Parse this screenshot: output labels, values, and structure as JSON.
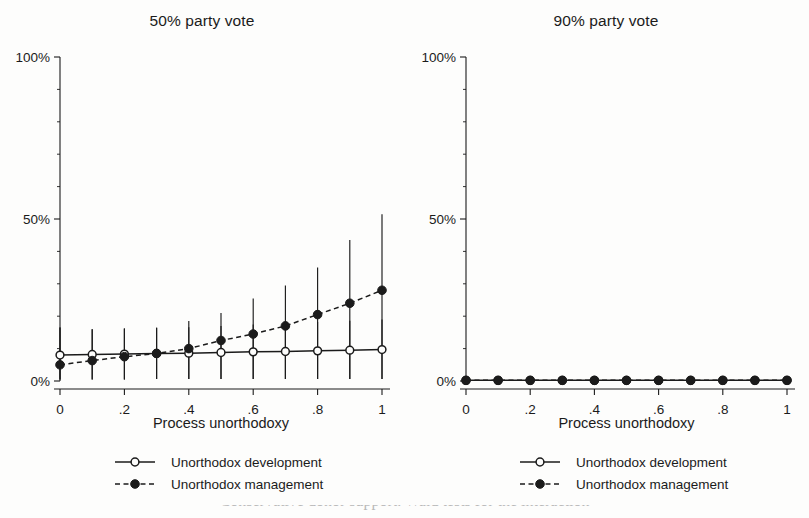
{
  "figure": {
    "background_color": "#fdfdfc",
    "ink_color": "#1b1b1b",
    "caption_partial": "Conservative donor support. Wald tests for the interaction"
  },
  "legend": {
    "development_label": "Unorthodox development",
    "management_label": "Unorthodox management"
  },
  "axes": {
    "xlabel": "Process unorthodoxy",
    "x_ticks": [
      "0",
      ".2",
      ".4",
      ".6",
      ".8",
      "1"
    ],
    "y_ticks": [
      "0%",
      "50%",
      "100%"
    ]
  },
  "chart_data": [
    {
      "type": "line",
      "panel": "left",
      "title": "50% party vote",
      "xlabel": "Process unorthodoxy",
      "ylabel": "",
      "xlim": [
        0,
        1
      ],
      "ylim": [
        0,
        100
      ],
      "y_tick_values": [
        0,
        50,
        100
      ],
      "y_tick_labels": [
        "0%",
        "50%",
        "100%"
      ],
      "x_tick_values": [
        0,
        0.2,
        0.4,
        0.6,
        0.8,
        1
      ],
      "x_tick_labels": [
        "0",
        ".2",
        ".4",
        ".6",
        ".8",
        "1"
      ],
      "x_minor_step": 0.1,
      "grid": false,
      "legend_position": "below-axis-center",
      "x": [
        0,
        0.1,
        0.2,
        0.3,
        0.4,
        0.5,
        0.6,
        0.7,
        0.8,
        0.9,
        1
      ],
      "series": [
        {
          "name": "Unorthodox development",
          "marker": "open-circle",
          "linestyle": "solid",
          "values": [
            8.0,
            8.2,
            8.3,
            8.5,
            8.6,
            8.8,
            9.0,
            9.1,
            9.3,
            9.5,
            9.7
          ],
          "ci_low": [
            0.5,
            0.5,
            0.5,
            0.6,
            0.6,
            0.6,
            0.6,
            0.6,
            0.6,
            0.6,
            0.6
          ],
          "ci_high": [
            16.5,
            16.0,
            16.2,
            16.4,
            16.6,
            17.0,
            17.4,
            17.8,
            18.2,
            18.6,
            19.0
          ]
        },
        {
          "name": "Unorthodox management",
          "marker": "filled-circle",
          "linestyle": "dashed",
          "values": [
            5.0,
            6.3,
            7.5,
            8.5,
            10.0,
            12.5,
            14.5,
            17.0,
            20.5,
            24.0,
            28.0
          ],
          "ci_low": [
            0.5,
            0.5,
            0.5,
            0.6,
            0.6,
            0.6,
            0.6,
            0.6,
            0.6,
            0.6,
            0.6
          ],
          "ci_high": [
            16.5,
            16.0,
            16.2,
            16.4,
            18.5,
            21.0,
            25.5,
            29.5,
            35.0,
            43.5,
            51.5
          ]
        }
      ]
    },
    {
      "type": "line",
      "panel": "right",
      "title": "90% party vote",
      "xlabel": "Process unorthodoxy",
      "ylabel": "",
      "xlim": [
        0,
        1
      ],
      "ylim": [
        0,
        100
      ],
      "y_tick_values": [
        0,
        50,
        100
      ],
      "y_tick_labels": [
        "0%",
        "50%",
        "100%"
      ],
      "x_tick_values": [
        0,
        0.2,
        0.4,
        0.6,
        0.8,
        1
      ],
      "x_tick_labels": [
        "0",
        ".2",
        ".4",
        ".6",
        ".8",
        "1"
      ],
      "x_minor_step": 0.1,
      "grid": false,
      "legend_position": "below-axis-center",
      "x": [
        0,
        0.1,
        0.2,
        0.3,
        0.4,
        0.5,
        0.6,
        0.7,
        0.8,
        0.9,
        1
      ],
      "series": [
        {
          "name": "Unorthodox development",
          "marker": "open-circle",
          "linestyle": "solid",
          "values": [
            0.2,
            0.2,
            0.2,
            0.2,
            0.2,
            0.2,
            0.2,
            0.2,
            0.2,
            0.2,
            0.2
          ],
          "ci_low": [
            0.0,
            0.0,
            0.0,
            0.0,
            0.0,
            0.0,
            0.0,
            0.0,
            0.0,
            0.0,
            0.0
          ],
          "ci_high": [
            0.6,
            0.6,
            0.6,
            0.6,
            0.6,
            0.6,
            0.6,
            0.6,
            0.6,
            0.6,
            0.6
          ]
        },
        {
          "name": "Unorthodox management",
          "marker": "filled-circle",
          "linestyle": "dashed",
          "values": [
            0.2,
            0.2,
            0.2,
            0.2,
            0.2,
            0.2,
            0.2,
            0.2,
            0.2,
            0.2,
            0.2
          ],
          "ci_low": [
            0.0,
            0.0,
            0.0,
            0.0,
            0.0,
            0.0,
            0.0,
            0.0,
            0.0,
            0.0,
            0.0
          ],
          "ci_high": [
            0.6,
            0.6,
            0.6,
            0.6,
            0.6,
            0.6,
            0.6,
            0.6,
            0.6,
            0.6,
            0.6
          ]
        }
      ]
    }
  ]
}
